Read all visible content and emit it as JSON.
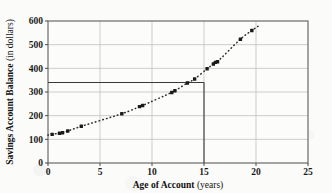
{
  "chart_data": {
    "type": "scatter",
    "title": "",
    "xlabel": "Age of Account",
    "xlabel_unit": "(years)",
    "ylabel": "Savings Account Balance",
    "ylabel_unit": "(in dollars)",
    "xlim": [
      0,
      25
    ],
    "ylim": [
      0,
      600
    ],
    "xticks": [
      0,
      5,
      10,
      15,
      20,
      25
    ],
    "xtick_labels": [
      "0",
      "5",
      "10",
      "15",
      "20",
      "25"
    ],
    "yticks": [
      0,
      100,
      200,
      300,
      400,
      500,
      600
    ],
    "ytick_labels": [
      "0",
      "100",
      "200",
      "300",
      "400",
      "500",
      "600"
    ],
    "grid": true,
    "legend": "none",
    "marker": "filled-square",
    "marker_color": "#1a1a1a",
    "trend_line_style": "dotted",
    "trend_line_color": "#2a2a2a",
    "points": [
      {
        "x": 0.4,
        "y": 121
      },
      {
        "x": 1.1,
        "y": 126
      },
      {
        "x": 1.4,
        "y": 128
      },
      {
        "x": 1.9,
        "y": 135
      },
      {
        "x": 3.2,
        "y": 155
      },
      {
        "x": 7.1,
        "y": 208
      },
      {
        "x": 8.8,
        "y": 238
      },
      {
        "x": 9.1,
        "y": 243
      },
      {
        "x": 11.9,
        "y": 298
      },
      {
        "x": 12.2,
        "y": 305
      },
      {
        "x": 13.4,
        "y": 338
      },
      {
        "x": 14.1,
        "y": 355
      },
      {
        "x": 15.3,
        "y": 398
      },
      {
        "x": 15.9,
        "y": 418
      },
      {
        "x": 16.1,
        "y": 425
      },
      {
        "x": 16.3,
        "y": 428
      },
      {
        "x": 18.5,
        "y": 523
      },
      {
        "x": 19.6,
        "y": 560
      }
    ],
    "annotations": {
      "reference_y": 340,
      "reference_x": 15,
      "description": "Horizontal reference line at balance 340 from age 0 to age 15, with vertical drop line at age 15 down to 0."
    }
  }
}
